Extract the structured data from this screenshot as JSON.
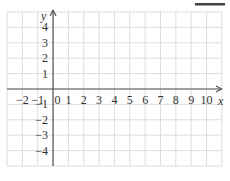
{
  "figure": {
    "type": "coordinate-grid",
    "x_axis": {
      "label": "x",
      "min": -3,
      "max": 11,
      "tick_labels": [
        "−2",
        "−1",
        "0",
        "1",
        "2",
        "3",
        "4",
        "5",
        "6",
        "7",
        "8",
        "9",
        "10"
      ],
      "tick_values": [
        -2,
        -1,
        0,
        1,
        2,
        3,
        4,
        5,
        6,
        7,
        8,
        9,
        10
      ]
    },
    "y_axis": {
      "label": "y",
      "min": -5,
      "max": 5,
      "tick_labels": [
        "4",
        "3",
        "2",
        "1",
        "−1",
        "−2",
        "−3",
        "−4"
      ],
      "tick_values": [
        4,
        3,
        2,
        1,
        -1,
        -2,
        -3,
        -4
      ]
    },
    "colors": {
      "grid": "#dcdcdc",
      "axis": "#555555",
      "text": "#333333",
      "corner_bar": "#444444"
    }
  }
}
